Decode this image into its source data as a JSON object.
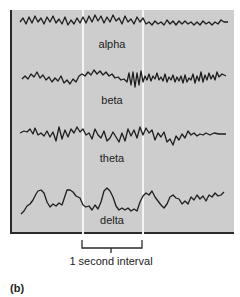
{
  "figure": {
    "label": "(b)",
    "interval_label": "1 second interval",
    "colors": {
      "panel_bg": "#cdcdcd",
      "trace": "#1e1e1e",
      "interval_lines": "#f4f4f4",
      "axis": "#2a2a2a"
    },
    "waves": [
      {
        "name": "alpha",
        "label": "alpha"
      },
      {
        "name": "beta",
        "label": "beta"
      },
      {
        "name": "theta",
        "label": "theta"
      },
      {
        "name": "delta",
        "label": "delta"
      }
    ]
  }
}
